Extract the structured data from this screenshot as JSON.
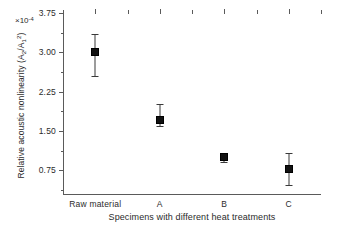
{
  "chart_data": {
    "type": "scatter",
    "title": "",
    "xlabel": "Specimens with different heat treatments",
    "ylabel": "Relative acoustic nonlinearity (A2/A1^2)",
    "ylabel_parts": {
      "prefix": "Relative acoustic nonlinearity (A",
      "sub1": "2",
      "mid": "/A",
      "sub2": "1",
      "sup2": "2",
      "suffix": ")"
    },
    "y_multiplier": "×10",
    "y_multiplier_exponent": "-4",
    "categories": [
      "Raw material",
      "A",
      "B",
      "C"
    ],
    "yticks": [
      "0.75",
      "1.50",
      "2.25",
      "3.00",
      "3.75"
    ],
    "ytick_values": [
      0.75,
      1.5,
      2.25,
      3.0,
      3.75
    ],
    "ylim": [
      0.3,
      3.75
    ],
    "grid": false,
    "legend": "none",
    "series": [
      {
        "name": "Relative acoustic nonlinearity",
        "values": [
          3.0,
          1.72,
          1.0,
          0.78
        ],
        "error_upper": [
          0.35,
          0.3,
          0.09,
          0.3
        ],
        "error_lower": [
          0.45,
          0.13,
          0.09,
          0.31
        ]
      }
    ],
    "points": [
      {
        "category": "Raw material",
        "value": 3.0,
        "err_up": 0.35,
        "err_down": 0.45
      },
      {
        "category": "A",
        "value": 1.72,
        "err_up": 0.3,
        "err_down": 0.13
      },
      {
        "category": "B",
        "value": 1.0,
        "err_up": 0.09,
        "err_down": 0.09
      },
      {
        "category": "C",
        "value": 0.78,
        "err_up": 0.3,
        "err_down": 0.31
      }
    ],
    "colors": {
      "marker": "#111111",
      "error_bar": "#3a3a3a",
      "axis": "#5a5a5a",
      "text": "#2b2b2b",
      "background": "#ffffff"
    }
  }
}
